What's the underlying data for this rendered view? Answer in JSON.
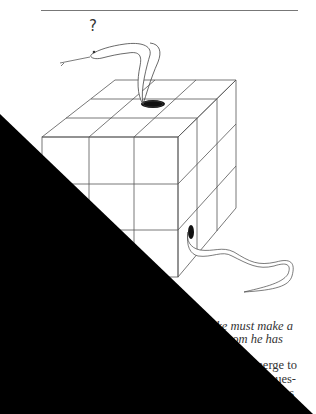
{
  "page": {
    "background": "#ffffff",
    "rule_color": "#777777"
  },
  "figure": {
    "question_mark": "?",
    "line_color": "#333333"
  },
  "caption": {
    "lines": [
      "ake must make a",
      "om he has"
    ]
  },
  "body": {
    "lines": [
      "merge to",
      "ues-",
      "s"
    ]
  },
  "redaction": {
    "color": "#000000",
    "shape": "triangle covering lower-left half"
  }
}
